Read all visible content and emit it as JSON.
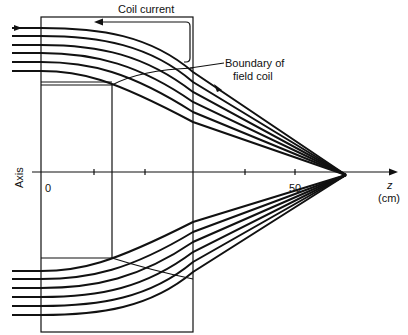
{
  "labels": {
    "coil_current": "Coil current",
    "boundary_line1": "Boundary of",
    "boundary_line2": "field coil",
    "axis": "Axis",
    "z": "z",
    "unit": "(cm)",
    "tick_0": "0",
    "tick_50": "50"
  },
  "colors": {
    "ink": "#111111",
    "background": "#ffffff"
  }
}
